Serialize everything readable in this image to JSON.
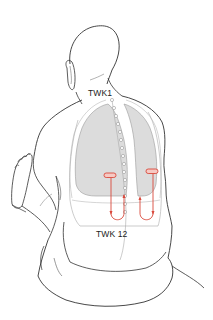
{
  "figure": {
    "labels": {
      "top_vertebra": "TWK1",
      "bottom_vertebra": "TWK 12"
    },
    "colors": {
      "outline": "#333333",
      "lung_fill": "#dcdcdc",
      "lung_outline": "#9a9a9a",
      "spine": "#9a9a9a",
      "marker": "#d9483b",
      "marker_fill": "#f6c9c3"
    },
    "markers": [
      {
        "side": "left",
        "type": "bar-with-down-up-arrow"
      },
      {
        "side": "right",
        "type": "bar-with-down-up-arrow"
      }
    ]
  }
}
